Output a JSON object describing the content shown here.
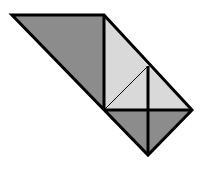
{
  "diagram": {
    "colors": {
      "dark_fill": "#8c8c8c",
      "light_fill": "#d9d9d9",
      "stroke": "#000000"
    },
    "pieces": [
      {
        "name": "large-dark-triangle",
        "shade": "dark"
      },
      {
        "name": "upper-light-triangle",
        "shade": "light"
      },
      {
        "name": "inner-light-triangle",
        "shade": "light"
      },
      {
        "name": "right-light-triangle",
        "shade": "light"
      },
      {
        "name": "bottom-left-dark-triangle",
        "shade": "dark"
      },
      {
        "name": "bottom-right-dark-triangle",
        "shade": "dark"
      }
    ]
  }
}
